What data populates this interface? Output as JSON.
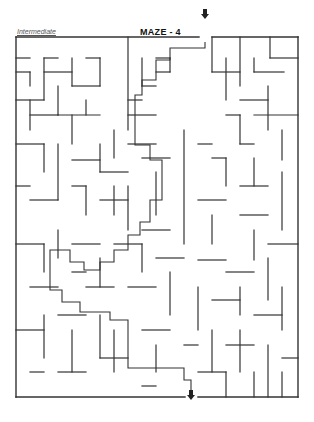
{
  "header": {
    "difficulty_label": "Intermediate",
    "title": "MAZE - 4"
  },
  "maze": {
    "origin": [
      16,
      37
    ],
    "cell": 14.1,
    "cols": 20,
    "rows": 25,
    "wall_color": "#333333",
    "border": {
      "x1": 16,
      "y1": 37,
      "x2": 298,
      "y2": 397
    },
    "entry_gap": {
      "x1": 199,
      "x2": 212,
      "side": "top"
    },
    "exit_gap": {
      "x1": 185,
      "x2": 198,
      "side": "bottom"
    },
    "walls": [
      [
        16,
        58,
        30,
        58
      ],
      [
        44,
        58,
        58,
        58
      ],
      [
        30,
        72,
        30,
        86
      ],
      [
        44,
        58,
        44,
        100
      ],
      [
        44,
        72,
        72,
        72
      ],
      [
        72,
        58,
        72,
        86
      ],
      [
        86,
        58,
        100,
        58
      ],
      [
        100,
        58,
        100,
        86
      ],
      [
        72,
        86,
        100,
        86
      ],
      [
        16,
        72,
        30,
        72
      ],
      [
        16,
        100,
        44,
        100
      ],
      [
        30,
        100,
        30,
        130
      ],
      [
        58,
        86,
        58,
        115
      ],
      [
        30,
        115,
        58,
        115
      ],
      [
        58,
        115,
        100,
        115
      ],
      [
        72,
        115,
        72,
        144
      ],
      [
        86,
        100,
        86,
        115
      ],
      [
        128,
        37,
        128,
        130
      ],
      [
        128,
        115,
        156,
        115
      ],
      [
        128,
        100,
        142,
        100
      ],
      [
        142,
        58,
        142,
        86
      ],
      [
        142,
        86,
        156,
        86
      ],
      [
        156,
        58,
        170,
        58
      ],
      [
        156,
        72,
        170,
        72
      ],
      [
        170,
        58,
        170,
        72
      ],
      [
        212,
        37,
        212,
        72
      ],
      [
        212,
        72,
        240,
        72
      ],
      [
        240,
        37,
        240,
        86
      ],
      [
        226,
        58,
        226,
        100
      ],
      [
        254,
        58,
        254,
        72
      ],
      [
        254,
        72,
        284,
        72
      ],
      [
        270,
        37,
        270,
        58
      ],
      [
        270,
        58,
        298,
        58
      ],
      [
        240,
        100,
        268,
        100
      ],
      [
        268,
        86,
        268,
        130
      ],
      [
        254,
        115,
        298,
        115
      ],
      [
        226,
        115,
        240,
        115
      ],
      [
        240,
        115,
        240,
        144
      ],
      [
        240,
        144,
        254,
        144
      ],
      [
        282,
        130,
        282,
        160
      ],
      [
        16,
        144,
        44,
        144
      ],
      [
        44,
        144,
        44,
        172
      ],
      [
        58,
        144,
        58,
        200
      ],
      [
        72,
        160,
        100,
        160
      ],
      [
        100,
        144,
        100,
        172
      ],
      [
        100,
        172,
        128,
        172
      ],
      [
        114,
        130,
        114,
        158
      ],
      [
        128,
        144,
        156,
        144
      ],
      [
        142,
        158,
        170,
        158
      ],
      [
        156,
        172,
        156,
        215
      ],
      [
        184,
        130,
        184,
        244
      ],
      [
        198,
        144,
        212,
        144
      ],
      [
        212,
        158,
        226,
        158
      ],
      [
        226,
        158,
        226,
        186
      ],
      [
        254,
        158,
        254,
        186
      ],
      [
        240,
        186,
        268,
        186
      ],
      [
        282,
        172,
        282,
        230
      ],
      [
        16,
        186,
        30,
        186
      ],
      [
        30,
        200,
        58,
        200
      ],
      [
        72,
        186,
        86,
        186
      ],
      [
        86,
        186,
        86,
        215
      ],
      [
        100,
        200,
        128,
        200
      ],
      [
        114,
        186,
        114,
        215
      ],
      [
        128,
        186,
        128,
        230
      ],
      [
        142,
        230,
        170,
        230
      ],
      [
        198,
        200,
        226,
        200
      ],
      [
        212,
        215,
        212,
        244
      ],
      [
        240,
        215,
        268,
        215
      ],
      [
        254,
        230,
        254,
        260
      ],
      [
        16,
        244,
        44,
        244
      ],
      [
        44,
        244,
        44,
        272
      ],
      [
        58,
        230,
        58,
        258
      ],
      [
        72,
        244,
        100,
        244
      ],
      [
        100,
        258,
        100,
        287
      ],
      [
        114,
        244,
        142,
        244
      ],
      [
        142,
        244,
        142,
        272
      ],
      [
        156,
        258,
        184,
        258
      ],
      [
        198,
        260,
        226,
        260
      ],
      [
        226,
        272,
        254,
        272
      ],
      [
        268,
        244,
        298,
        244
      ],
      [
        268,
        258,
        268,
        300
      ],
      [
        30,
        287,
        58,
        287
      ],
      [
        72,
        272,
        86,
        272
      ],
      [
        86,
        287,
        114,
        287
      ],
      [
        128,
        287,
        156,
        287
      ],
      [
        170,
        272,
        170,
        315
      ],
      [
        198,
        287,
        198,
        330
      ],
      [
        212,
        300,
        240,
        300
      ],
      [
        240,
        287,
        240,
        315
      ],
      [
        254,
        315,
        282,
        315
      ],
      [
        282,
        287,
        282,
        330
      ],
      [
        16,
        330,
        44,
        330
      ],
      [
        44,
        315,
        44,
        358
      ],
      [
        58,
        315,
        86,
        315
      ],
      [
        72,
        330,
        72,
        372
      ],
      [
        100,
        315,
        100,
        358
      ],
      [
        100,
        358,
        128,
        358
      ],
      [
        114,
        330,
        114,
        372
      ],
      [
        142,
        330,
        170,
        330
      ],
      [
        156,
        345,
        156,
        372
      ],
      [
        184,
        345,
        198,
        345
      ],
      [
        212,
        330,
        212,
        372
      ],
      [
        226,
        345,
        254,
        345
      ],
      [
        240,
        330,
        240,
        372
      ],
      [
        268,
        345,
        268,
        397
      ],
      [
        282,
        358,
        298,
        358
      ],
      [
        30,
        372,
        44,
        372
      ],
      [
        58,
        372,
        86,
        372
      ],
      [
        142,
        386,
        156,
        386
      ],
      [
        198,
        372,
        226,
        372
      ],
      [
        226,
        372,
        226,
        397
      ],
      [
        254,
        372,
        254,
        397
      ],
      [
        282,
        372,
        282,
        397
      ]
    ],
    "solution_path": [
      [
        205,
        42
      ],
      [
        205,
        48
      ],
      [
        170,
        48
      ],
      [
        170,
        60
      ],
      [
        156,
        60
      ],
      [
        156,
        80
      ],
      [
        142,
        80
      ],
      [
        142,
        95
      ],
      [
        135,
        95
      ],
      [
        135,
        145
      ],
      [
        150,
        145
      ],
      [
        150,
        160
      ],
      [
        162,
        160
      ],
      [
        162,
        200
      ],
      [
        150,
        200
      ],
      [
        150,
        222
      ],
      [
        140,
        222
      ],
      [
        140,
        235
      ],
      [
        128,
        235
      ],
      [
        128,
        250
      ],
      [
        114,
        250
      ],
      [
        114,
        262
      ],
      [
        100,
        262
      ],
      [
        100,
        270
      ],
      [
        84,
        270
      ],
      [
        84,
        262
      ],
      [
        70,
        262
      ],
      [
        70,
        250
      ],
      [
        50,
        250
      ],
      [
        50,
        290
      ],
      [
        62,
        290
      ],
      [
        62,
        302
      ],
      [
        80,
        302
      ],
      [
        80,
        312
      ],
      [
        110,
        312
      ],
      [
        110,
        320
      ],
      [
        128,
        320
      ],
      [
        128,
        368
      ],
      [
        184,
        368
      ],
      [
        184,
        380
      ],
      [
        191,
        380
      ],
      [
        191,
        390
      ]
    ],
    "entry_arrow": {
      "x": 205,
      "y": 14,
      "direction": "down"
    },
    "exit_arrow": {
      "x": 191,
      "y": 395,
      "direction": "down"
    }
  }
}
